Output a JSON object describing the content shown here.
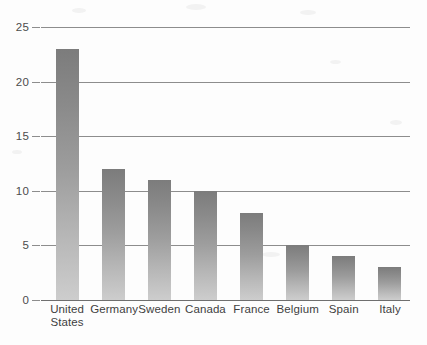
{
  "chart_data": {
    "type": "bar",
    "title": "",
    "xlabel": "",
    "ylabel": "",
    "ylim": [
      0,
      25
    ],
    "ytick_values": [
      0,
      5,
      10,
      15,
      20,
      25
    ],
    "ytick_labels": [
      "0",
      "5",
      "10",
      "15",
      "20",
      "25"
    ],
    "grid": true,
    "legend": false,
    "orientation": "vertical",
    "categories": [
      "United States",
      "Germany",
      "Sweden",
      "Canada",
      "France",
      "Belgium",
      "Spain",
      "Italy"
    ],
    "category_label_lines": [
      [
        "United",
        "States"
      ],
      [
        "Germany"
      ],
      [
        "Sweden"
      ],
      [
        "Canada"
      ],
      [
        "France"
      ],
      [
        "Belgium"
      ],
      [
        "Spain"
      ],
      [
        "Italy"
      ]
    ],
    "values": [
      23,
      12,
      11,
      10,
      8,
      5,
      4,
      3
    ],
    "bar_color_top": "#7c7c7c",
    "bar_color_bottom": "#cdcdcd",
    "gridline_color": "#8d8d8d",
    "axis_text_color": "#3f3f3f",
    "background_color": "#fdfdfd"
  },
  "caption": {
    "text": ""
  }
}
